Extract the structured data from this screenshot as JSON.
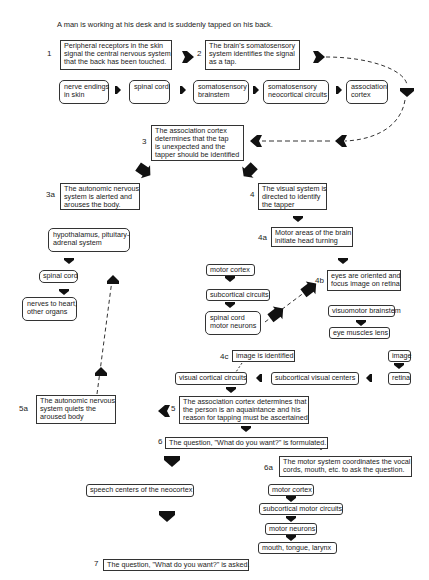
{
  "title": "A man is working at his desk and is suddenly tapped on his back.",
  "steps": {
    "s1": {
      "label": "1",
      "text": [
        "Peripheral receptors in the skin",
        "signal the central nervous system",
        "that the back has been touched."
      ]
    },
    "s2": {
      "label": "2",
      "text": [
        "The brain's somatosensory",
        "system identifies the signal",
        "as a tap."
      ]
    },
    "s3": {
      "label": "3",
      "text": [
        "The association cortex",
        "determines that the tap",
        "is unexpected and the",
        "tapper should be identified"
      ]
    },
    "s3a": {
      "label": "3a",
      "text": [
        "The autonomic nervous",
        "system is alerted and",
        "arouses the body."
      ]
    },
    "s4": {
      "label": "4",
      "text": [
        "The visual system is",
        "directed to identify",
        "the tapper"
      ]
    },
    "s4a": {
      "label": "4a",
      "text": [
        "Motor areas of the brain",
        "initiate head turning"
      ]
    },
    "s4b": {
      "label": "4b",
      "text": [
        "eyes are oriented and",
        "focus image on retina"
      ]
    },
    "s4c": {
      "label": "4c",
      "text": [
        "image is identified"
      ]
    },
    "s5": {
      "label": "5",
      "text": [
        "The association cortex determines that",
        "the person is an aquaintance and his",
        "reason for tapping must be ascertained"
      ]
    },
    "s5a": {
      "label": "5a",
      "text": [
        "The autonomic nervous",
        "system quiets the",
        "aroused body"
      ]
    },
    "s6": {
      "label": "6",
      "text": [
        "The question, \"What do you want?\" is formulated."
      ]
    },
    "s6a": {
      "label": "6a",
      "text": [
        "The motor system coordinates the vocal",
        "cords, mouth, etc. to ask the question."
      ]
    },
    "s7": {
      "label": "7",
      "text": [
        "The question, \"What do you want?\" is asked."
      ]
    }
  },
  "pathway_somatosensory": [
    [
      "nerve endings",
      "in skin"
    ],
    [
      "spinal cord"
    ],
    [
      "somatosensory",
      "brainstem"
    ],
    [
      "somatosensory",
      "neocortical circuits"
    ],
    [
      "association",
      "cortex"
    ]
  ],
  "pathway_autonomic": [
    [
      "hypothalamus, pituitary-",
      "adrenal system"
    ],
    [
      "spinal cord"
    ],
    [
      "nerves to heart,",
      "other organs"
    ]
  ],
  "pathway_head_motor": [
    [
      "motor cortex"
    ],
    [
      "subcortical circuits"
    ],
    [
      "spinal cord",
      "motor neurons"
    ]
  ],
  "pathway_eye_motor": [
    [
      "visuomotor brainstem"
    ],
    [
      "eye muscles lens"
    ]
  ],
  "pathway_visual": {
    "image": "image",
    "retina": "retina",
    "subcortical": "subcortical visual centers",
    "cortical": "visual cortical circuits"
  },
  "speech": "speech centers of the neocortex",
  "pathway_vocal_motor": [
    "motor cortex",
    "subcortical motor circuits",
    "motor neurons",
    "mouth, tongue, larynx"
  ],
  "colors": {
    "ink": "#1a1a1a",
    "background": "#ffffff"
  }
}
